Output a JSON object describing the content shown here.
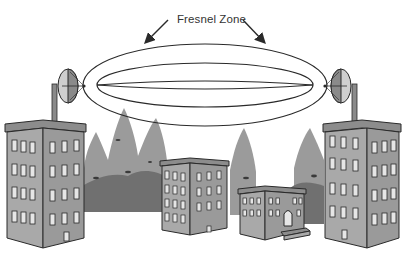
{
  "diagram": {
    "title_label": "Fresnel Zone",
    "colors": {
      "line": "#2a2a2a",
      "building_front": "#a9a9a9",
      "building_side": "#9a9a9a",
      "roof": "#8c8c8c",
      "window": "#e6e6e6",
      "tree_light": "#9b9b9b",
      "tree_dark": "#6f6f6f",
      "dish_light": "#cfcfcf",
      "dish_dark": "#8a8a8a"
    },
    "elements": {
      "left_antenna": "parabolic-dish",
      "right_antenna": "parabolic-dish",
      "zone": "nested-ellipses"
    }
  }
}
